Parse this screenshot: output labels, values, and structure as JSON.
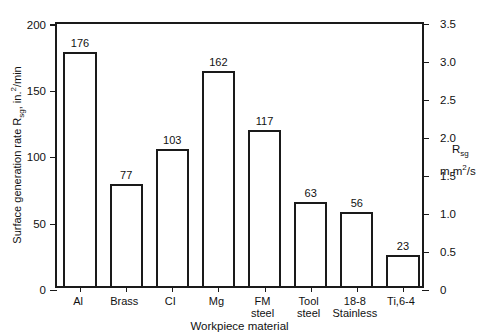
{
  "chart_data": {
    "type": "bar",
    "title": "",
    "subtitle": "",
    "xlabel": "Workpiece material",
    "ylabel": "Surface generation rate Rsg, in.2/min",
    "ylabel_parts": {
      "pre": "Surface generation rate R",
      "sub": "sg",
      "mid": ", in.",
      "sup": "2",
      "post": "/min"
    },
    "y2label": "Rsg m m2/s",
    "y2label_parts": {
      "main": "R",
      "main_sub": "sg",
      "unit_pre": "m m",
      "unit_sup": "2",
      "unit_post": "/s"
    },
    "categories": [
      "Al",
      "Brass",
      "CI",
      "Mg",
      "FM\nsteel",
      "Tool\nsteel",
      "18-8\nStainless",
      "Ti,6-4"
    ],
    "values": [
      176,
      77,
      103,
      162,
      117,
      63,
      56,
      23
    ],
    "data_labels": [
      "176",
      "77",
      "103",
      "162",
      "117",
      "63",
      "56",
      "23"
    ],
    "ylim": [
      0,
      200
    ],
    "yticks": [
      0,
      50,
      100,
      150,
      200
    ],
    "ytick_labels": [
      "0",
      "50",
      "100",
      "150",
      "200"
    ],
    "y2lim": [
      0,
      3.5
    ],
    "y2ticks": [
      0,
      0.5,
      1.0,
      1.5,
      2.0,
      2.5,
      3.0,
      3.5
    ],
    "y2tick_labels": [
      "0",
      "0.5",
      "1.0",
      "1.5",
      "2.0",
      "2.5",
      "3.0",
      "3.5"
    ],
    "grid": false,
    "legend": null,
    "legend_position": "none",
    "bar_fill": "#ffffff",
    "bar_edge": "#1a1a1a",
    "background": "#ffffff"
  },
  "colors": {
    "line": "#1a1a1a",
    "text": "#111111",
    "background": "#ffffff"
  }
}
